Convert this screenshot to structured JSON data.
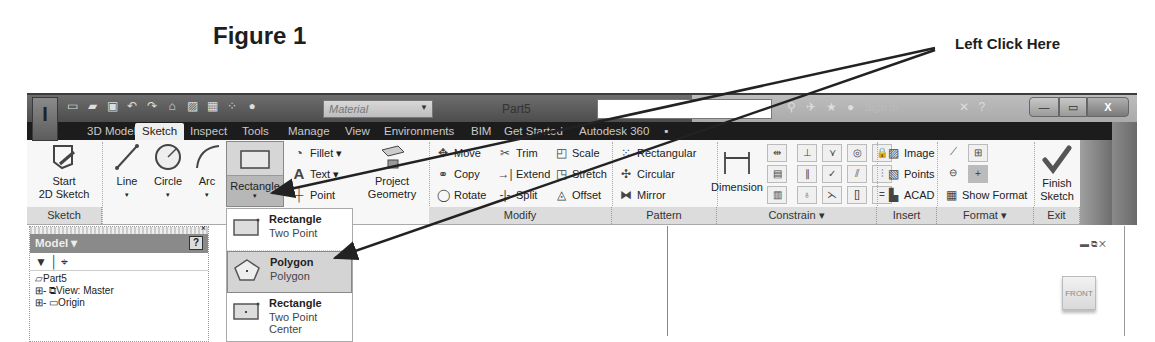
{
  "figure": {
    "title": "Figure 1",
    "callout": "Left Click Here"
  },
  "window": {
    "document_title": "Part5",
    "material_placeholder": "Material",
    "sign_in": "Sign In",
    "help": "?",
    "buttons": {
      "minimize": "—",
      "maximize": "▭",
      "close": "X"
    }
  },
  "tabs": [
    {
      "label": "3D Model",
      "active": false
    },
    {
      "label": "Sketch",
      "active": true
    },
    {
      "label": "Inspect",
      "active": false
    },
    {
      "label": "Tools",
      "active": false
    },
    {
      "label": "Manage",
      "active": false
    },
    {
      "label": "View",
      "active": false
    },
    {
      "label": "Environments",
      "active": false
    },
    {
      "label": "BIM",
      "active": false
    },
    {
      "label": "Get Started",
      "active": false
    },
    {
      "label": "Autodesk 360",
      "active": false
    }
  ],
  "ribbon": {
    "sketch_panel": {
      "title": "Sketch",
      "start": "Start",
      "start2": "2D Sketch"
    },
    "create": {
      "line": "Line",
      "circle": "Circle",
      "arc": "Arc",
      "rectangle": "Rectangle",
      "fillet": "Fillet",
      "text": "Text",
      "point": "Point",
      "project1": "Project",
      "project2": "Geometry"
    },
    "modify": {
      "title": "Modify",
      "move": "Move",
      "trim": "Trim",
      "scale": "Scale",
      "copy": "Copy",
      "extend": "Extend",
      "stretch": "Stretch",
      "rotate": "Rotate",
      "split": "Split",
      "offset": "Offset"
    },
    "pattern": {
      "title": "Pattern",
      "rectangular": "Rectangular",
      "circular": "Circular",
      "mirror": "Mirror"
    },
    "constrain": {
      "title": "Constrain ▾",
      "dimension": "Dimension"
    },
    "insert": {
      "title": "Insert",
      "image": "Image",
      "points": "Points",
      "acad": "ACAD"
    },
    "format": {
      "title": "Format ▾",
      "show_format": "Show Format"
    },
    "exit": {
      "title": "Exit",
      "finish1": "Finish",
      "finish2": "Sketch"
    }
  },
  "rectangle_dropdown": [
    {
      "title": "Rectangle",
      "subtitle": "Two Point",
      "icon": "rectangle-two-point-icon",
      "selected": false
    },
    {
      "title": "Polygon",
      "subtitle": "Polygon",
      "icon": "polygon-icon",
      "selected": true
    },
    {
      "title": "Rectangle",
      "subtitle": "Two Point Center",
      "icon": "rectangle-center-icon",
      "selected": false
    }
  ],
  "browser": {
    "header": "Model ▾",
    "help": "?",
    "tree": [
      "Part5",
      "View: Master",
      "Origin"
    ]
  },
  "viewport": {
    "viewcube_face": "FRONT"
  }
}
